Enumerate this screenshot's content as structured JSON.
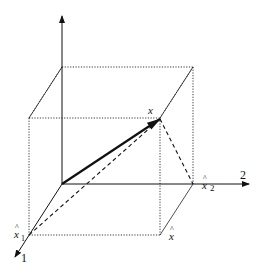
{
  "diagram": {
    "type": "3d-vector-projection",
    "axes": [
      {
        "label": "1",
        "direction": "toward viewer (lower-left)"
      },
      {
        "label": "2",
        "direction": "right"
      },
      {
        "label": "",
        "direction": "up"
      }
    ],
    "labels": {
      "vector_x": "x",
      "hat_x1": "x",
      "hat_x1_sub": "1",
      "hat_x2": "x",
      "hat_x2_sub": "2",
      "hat_x": "x",
      "axis1": "1",
      "axis2": "2",
      "hat": "^"
    },
    "colors": {
      "ink": "#111111",
      "background": "#ffffff"
    }
  }
}
